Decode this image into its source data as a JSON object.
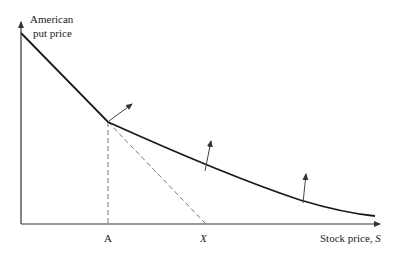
{
  "diagram": {
    "y_axis_label_line1": "American",
    "y_axis_label_line2": "put price",
    "x_axis_label_prefix": "Stock price, ",
    "x_axis_label_var": "S",
    "tick_A": "A",
    "tick_X": "X",
    "colors": {
      "curve": "#1a1a1a",
      "axis": "#333333",
      "dashed": "#777777",
      "arrow": "#444444"
    },
    "elements": {
      "curve": "American put price curve, linear (intrinsic value X - S) from S=0 to S=A, then convex decreasing beyond A",
      "dashed_vertical": "Vertical dashed line at S=A from curve down to axis",
      "dashed_diagonal": "Dashed continuation of intrinsic value line from knee to X on the axis",
      "normal_arrows": "Three arrows normal to the curve, pointing outward/up"
    }
  }
}
